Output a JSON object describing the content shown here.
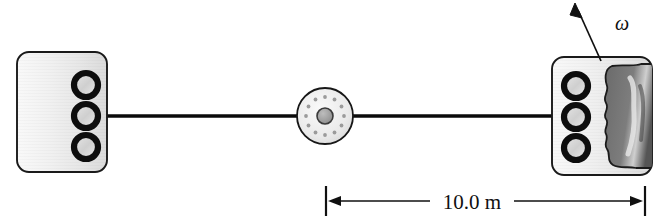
{
  "figure": {
    "kind": "physics-diagram",
    "background_color": "#ffffff",
    "width": 655,
    "height": 222
  },
  "labels": {
    "distance": "10.0 m",
    "angular_velocity": "ω"
  },
  "colors": {
    "block_fill_light": "#f4f4f4",
    "block_fill_mid": "#d8d8d8",
    "block_stroke": "#1a1a1a",
    "ring_stroke": "#0d0d0d",
    "ring_fill": "#d9d9d9",
    "pulley_fill": "#ededed",
    "pulley_hub": "#9a9a9a",
    "pulley_stroke": "#171717",
    "cord": "#0a0a0a",
    "blob_fill": "#6e6e6e",
    "blob_stroke": "#1a1a1a",
    "dimension_line": "#101010",
    "text": "#101010"
  },
  "geometry": {
    "left_block": {
      "x": 17,
      "y": 52,
      "width": 90,
      "height": 120,
      "radius": 12
    },
    "right_block": {
      "x": 552,
      "y": 57,
      "width": 100,
      "height": 118,
      "radius": 12
    },
    "pulley": {
      "cx": 325,
      "cy": 116,
      "r_outer": 28,
      "r_hub": 8,
      "bolt_count": 12,
      "bolt_r": 19
    },
    "cord_y": 116,
    "cord_left": {
      "x1": 107,
      "x2": 297
    },
    "cord_right": {
      "x1": 353,
      "x2": 552
    },
    "dimension": {
      "y": 201,
      "x_left": 325,
      "x_right": 645
    },
    "omega_arrow": {
      "x1": 601,
      "y1": 60,
      "x2": 575,
      "y2": 6
    },
    "omega_label": {
      "x": 617,
      "y": 26
    }
  },
  "elements": {
    "left_block_name": "left block",
    "right_block_name": "right block",
    "pulley_name": "pulley",
    "cord_name": "connecting cord",
    "ring_name": "ring hole",
    "blob_name": "shaded region"
  },
  "rings": {
    "left": [
      {
        "cx": 86,
        "cy": 85
      },
      {
        "cx": 86,
        "cy": 116
      },
      {
        "cx": 86,
        "cy": 147
      }
    ],
    "right": [
      {
        "cx": 576,
        "cy": 86
      },
      {
        "cx": 576,
        "cy": 117
      },
      {
        "cx": 576,
        "cy": 148
      }
    ],
    "outer_r": 12,
    "inner_r": 7.5
  }
}
